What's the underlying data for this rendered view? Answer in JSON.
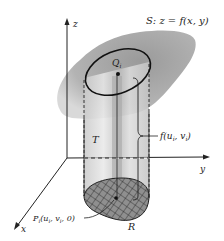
{
  "diagram": {
    "title_label": "S: z = f(x, y)",
    "axes": {
      "z": "z",
      "y": "y",
      "x": "x"
    },
    "labels": {
      "top_point": "Q",
      "top_point_sub": "i",
      "solid": "T",
      "height": "f(u",
      "height_sub1": "i",
      "height_mid": ", v",
      "height_sub2": "i",
      "height_end": ")",
      "base_point": "P",
      "base_point_sub": "i",
      "base_point_args": "(u",
      "base_point_args_sub1": "i",
      "base_point_args_mid": ", v",
      "base_point_args_sub2": "i",
      "base_point_args_end": ", 0)",
      "region": "R"
    },
    "colors": {
      "surface": "#a9a9a9",
      "cylinder": "#d6d6d6",
      "region": "#8e8e8e",
      "line": "#222222"
    }
  }
}
